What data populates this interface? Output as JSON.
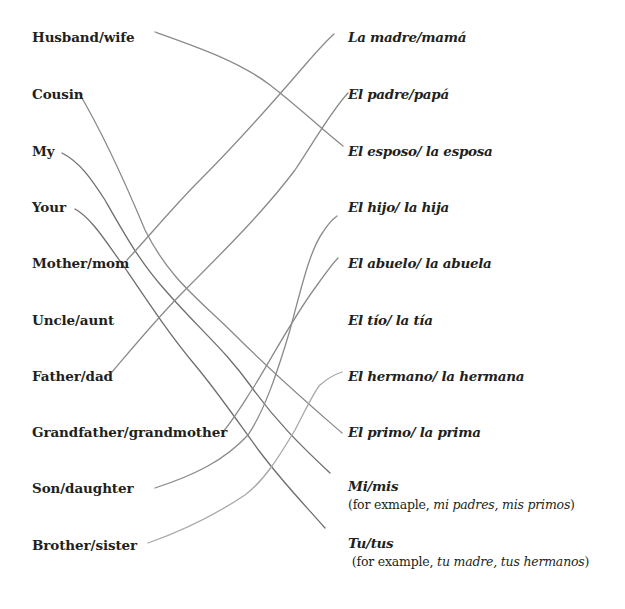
{
  "worksheet": {
    "left_column": [
      {
        "label": "Husband/wife",
        "x": 32,
        "y": 30
      },
      {
        "label": "Cousin",
        "x": 32,
        "y": 86
      },
      {
        "label": "My",
        "x": 32,
        "y": 143
      },
      {
        "label": "Your",
        "x": 32,
        "y": 199
      },
      {
        "label": "Mother/mom",
        "x": 32,
        "y": 255
      },
      {
        "label": "Uncle/aunt",
        "x": 32,
        "y": 312
      },
      {
        "label": "Father/dad",
        "x": 32,
        "y": 368
      },
      {
        "label": "Grandfather/grandmother",
        "x": 32,
        "y": 424
      },
      {
        "label": "Son/daughter",
        "x": 32,
        "y": 480
      },
      {
        "label": "Brother/sister",
        "x": 32,
        "y": 537
      }
    ],
    "right_column": [
      {
        "label": "La madre/mamá",
        "x": 348,
        "y": 30
      },
      {
        "label": "El padre/papá",
        "x": 348,
        "y": 86
      },
      {
        "label": "El esposo/ la esposa",
        "x": 348,
        "y": 143
      },
      {
        "label": "El hijo/ la hija",
        "x": 348,
        "y": 199
      },
      {
        "label": "El abuelo/ la abuela",
        "x": 348,
        "y": 255
      },
      {
        "label": "El tío/ la tía",
        "x": 348,
        "y": 312
      },
      {
        "label": "El hermano/ la hermana",
        "x": 348,
        "y": 368
      },
      {
        "label": "El primo/ la prima",
        "x": 348,
        "y": 424
      },
      {
        "label": "Mi/mis",
        "x": 348,
        "y": 480
      },
      {
        "label": "Tu/tus",
        "x": 348,
        "y": 537
      }
    ],
    "examples": {
      "mi": {
        "prefix": "(for exmaple, ",
        "italic": "mi padres, mis primos",
        "suffix": ")"
      },
      "tu": {
        "prefix": " (for example, ",
        "italic": "tu madre, tus hermanos",
        "suffix": ")"
      }
    },
    "connections": [
      {
        "from": "Husband/wife",
        "to": "El esposo/ la esposa"
      },
      {
        "from": "Cousin",
        "to": "El primo/ la prima"
      },
      {
        "from": "My",
        "to": "Mi/mis"
      },
      {
        "from": "Your",
        "to": "Tu/tus"
      },
      {
        "from": "Mother/mom",
        "to": "La madre/mamá"
      },
      {
        "from": "Father/dad",
        "to": "El padre/papá"
      },
      {
        "from": "Grandfather/grandmother",
        "to": "El abuelo/ la abuela"
      },
      {
        "from": "Son/daughter",
        "to": "El hijo/ la hija"
      },
      {
        "from": "Brother/sister",
        "to": "El hermano/ la hermana"
      }
    ]
  }
}
